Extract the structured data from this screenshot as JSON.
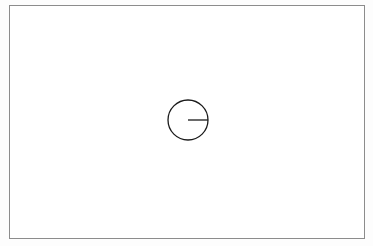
{
  "figure": {
    "kind": "geometric-line-drawing",
    "background_color": "#ffffff",
    "page_tint_color": "#fdfdfd",
    "frame": {
      "label": "page-border",
      "x": 9,
      "y": 5,
      "width": 356,
      "height": 234,
      "stroke_color": "#8c8c8c",
      "stroke_width": 1
    },
    "circle": {
      "label": "circle",
      "center_x": 188,
      "center_y": 120,
      "radius": 20,
      "stroke_color": "#1a1a1a",
      "stroke_width": 1.3,
      "fill": "none"
    },
    "radius_line": {
      "label": "radius-segment",
      "x1": 188,
      "y1": 120,
      "x2": 208,
      "y2": 120,
      "stroke_color": "#1a1a1a",
      "stroke_width": 1.3,
      "direction": "east",
      "length": 20
    }
  },
  "chart_data": {
    "type": "scatter",
    "title": "",
    "xlabel": "",
    "ylabel": "",
    "annotations": [],
    "shapes": [
      {
        "shape": "rectangle",
        "role": "border-frame",
        "x": 9,
        "y": 5,
        "width": 356,
        "height": 234,
        "stroke": "#8c8c8c",
        "fill": "none"
      },
      {
        "shape": "circle",
        "role": "primary-circle",
        "cx": 188,
        "cy": 120,
        "r": 20,
        "stroke": "#1a1a1a",
        "fill": "none"
      },
      {
        "shape": "line",
        "role": "radius",
        "x1": 188,
        "y1": 120,
        "x2": 208,
        "y2": 120,
        "stroke": "#1a1a1a"
      }
    ]
  }
}
